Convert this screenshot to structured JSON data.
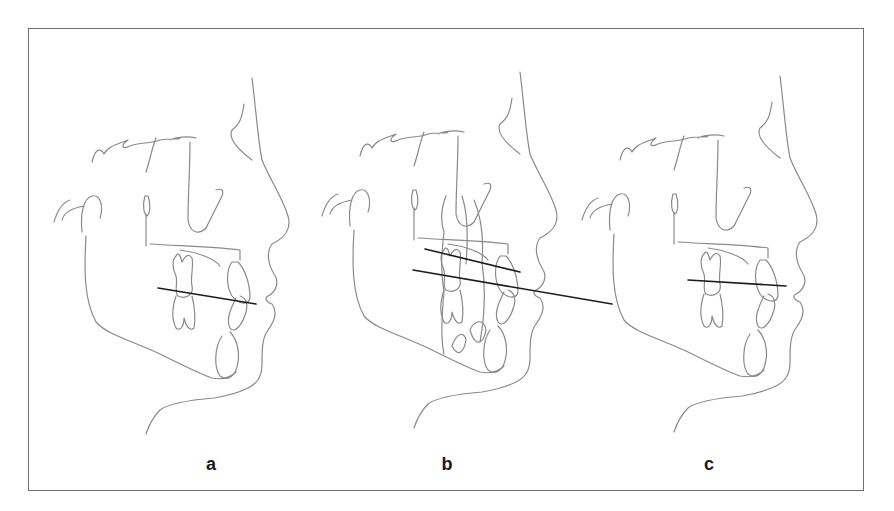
{
  "figure": {
    "panels": [
      {
        "id": "a",
        "label": "a",
        "description": "Profile tracing with single occlusal plane line"
      },
      {
        "id": "b",
        "label": "b",
        "description": "Superimposed tracing with two occlusal plane lines; lower line extended"
      },
      {
        "id": "c",
        "label": "c",
        "description": "Profile tracing with flattened occlusal plane line"
      }
    ],
    "colors": {
      "trace": "#8a8a8a",
      "plane_line": "#1c1c1c",
      "frame": "#6e6e6e",
      "background": "#ffffff"
    }
  }
}
